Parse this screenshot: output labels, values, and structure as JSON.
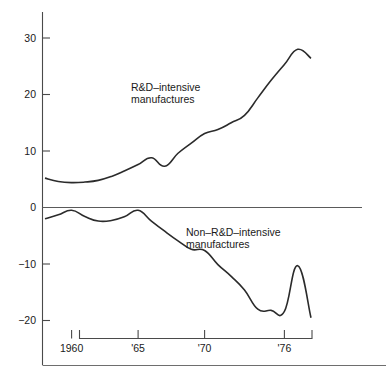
{
  "chart_data": {
    "type": "line",
    "title": "",
    "subtitle": "",
    "xlabel": "",
    "ylabel": "",
    "xlim": [
      1958,
      1979
    ],
    "ylim": [
      -22,
      33
    ],
    "grid": false,
    "legend_position": "inline-annotation",
    "y_ticks": [
      {
        "value": 30,
        "label": "30"
      },
      {
        "value": 20,
        "label": "20"
      },
      {
        "value": 10,
        "label": "10"
      },
      {
        "value": 0,
        "label": "0"
      },
      {
        "value": -10,
        "label": "−10"
      },
      {
        "value": -20,
        "label": "−20"
      }
    ],
    "x_ticks": [
      {
        "value": 1960,
        "label": "1960"
      },
      {
        "value": 1965,
        "label": "'65"
      },
      {
        "value": 1970,
        "label": "'70"
      },
      {
        "value": 1976,
        "label": "'76"
      }
    ],
    "x": [
      1958,
      1959,
      1960,
      1961,
      1962,
      1963,
      1964,
      1965,
      1966,
      1967,
      1968,
      1969,
      1970,
      1971,
      1972,
      1973,
      1974,
      1975,
      1976,
      1977,
      1978
    ],
    "series": [
      {
        "name": "R&D-intensive manufactures",
        "label_line1": "R&D–intensive",
        "label_line2": "manufactures",
        "color": "#2b2b2b",
        "values": [
          5.2,
          4.6,
          4.4,
          4.5,
          4.8,
          5.5,
          6.5,
          7.6,
          8.8,
          7.3,
          9.6,
          11.4,
          13.1,
          13.8,
          15.0,
          16.3,
          19.4,
          22.5,
          25.3,
          28.0,
          26.4
        ]
      },
      {
        "name": "Non-R&D-intensive manufactures",
        "label_line1": "Non–R&D–intensive",
        "label_line2": "manufactures",
        "color": "#2b2b2b",
        "values": [
          -2.0,
          -1.3,
          -0.5,
          -1.6,
          -2.4,
          -2.3,
          -1.6,
          -0.5,
          -2.4,
          -4.2,
          -5.9,
          -7.4,
          -7.6,
          -10.1,
          -12.2,
          -14.6,
          -18.0,
          -18.2,
          -18.4,
          -10.3,
          -19.5
        ]
      }
    ],
    "annotations": [
      {
        "name": "rd-intensive-label",
        "text_line1": "R&D–intensive",
        "text_line2": "manufactures",
        "x_px": 131,
        "y_px": 91
      },
      {
        "name": "non-rd-intensive-label",
        "text_line1": "Non–R&D–intensive",
        "text_line2": "manufactures",
        "x_px": 186,
        "y_px": 236
      }
    ]
  },
  "axes": {
    "y_axis_name": "vertical-axis",
    "x_axis_name": "horizontal-axis",
    "zero_line_name": "zero-baseline"
  }
}
